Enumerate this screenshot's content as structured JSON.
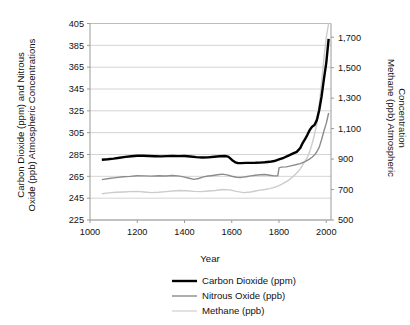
{
  "chart_data": {
    "type": "line",
    "title": "",
    "xlabel": "Year",
    "ylabel": "Carbon Dioxide (ppm) and Nitrous Oxide (ppb) Atmospheric Concentrations",
    "y2label": "Methane (ppb) Atmospheric Concentration",
    "xlim": [
      1000,
      2020
    ],
    "ylim": [
      225,
      405
    ],
    "y2lim": [
      500,
      1790
    ],
    "grid": true,
    "legend_position": "bottom",
    "x_ticks": [
      1000,
      1200,
      1400,
      1600,
      1800,
      2000
    ],
    "x_tick_labels": [
      "1000",
      "1200",
      "1400",
      "1600",
      "1800",
      "2000"
    ],
    "y_ticks": [
      225,
      245,
      265,
      285,
      305,
      325,
      345,
      365,
      385,
      405
    ],
    "y_tick_labels": [
      "225",
      "245",
      "265",
      "285",
      "305",
      "325",
      "345",
      "365",
      "385",
      "405"
    ],
    "y2_ticks": [
      500,
      700,
      900,
      1100,
      1300,
      1500,
      1700
    ],
    "y2_tick_labels": [
      "500",
      "700",
      "900",
      "1,100",
      "1,300",
      "1,500",
      "1,700"
    ],
    "series": [
      {
        "name": "Carbon Dioxide (ppm)",
        "axis": "left",
        "color": "#000000",
        "width": 2.4,
        "x": [
          1050,
          1075,
          1100,
          1125,
          1150,
          1175,
          1200,
          1225,
          1250,
          1275,
          1300,
          1325,
          1350,
          1375,
          1400,
          1425,
          1450,
          1475,
          1500,
          1525,
          1550,
          1570,
          1585,
          1595,
          1605,
          1615,
          1625,
          1640,
          1660,
          1680,
          1700,
          1720,
          1740,
          1760,
          1780,
          1800,
          1820,
          1840,
          1860,
          1875,
          1890,
          1900,
          1910,
          1920,
          1930,
          1940,
          1950,
          1960,
          1970,
          1980,
          1990,
          2000,
          2010
        ],
        "y": [
          280.2,
          280.6,
          281.2,
          282.0,
          282.8,
          283.4,
          283.9,
          283.8,
          283.6,
          283.4,
          283.3,
          283.5,
          283.7,
          283.5,
          283.6,
          283.2,
          282.6,
          282.3,
          282.4,
          282.9,
          283.4,
          283.6,
          283.0,
          281.2,
          279.2,
          277.8,
          277.2,
          277.1,
          277.3,
          277.3,
          277.4,
          277.6,
          277.9,
          278.3,
          279.0,
          280.5,
          282.0,
          284.0,
          286.0,
          287.4,
          291.0,
          295.5,
          299.0,
          303.0,
          307.5,
          310.5,
          312.0,
          316.5,
          325.5,
          338.0,
          354.0,
          369.0,
          391.0
        ]
      },
      {
        "name": "Nitrous Oxide (ppb)",
        "axis": "left",
        "color": "#8c8c8c",
        "width": 1.4,
        "x": [
          1050,
          1080,
          1110,
          1140,
          1170,
          1200,
          1230,
          1260,
          1290,
          1320,
          1350,
          1380,
          1400,
          1420,
          1440,
          1460,
          1480,
          1500,
          1520,
          1540,
          1560,
          1580,
          1600,
          1620,
          1640,
          1660,
          1680,
          1700,
          1720,
          1740,
          1760,
          1780,
          1795,
          1800,
          1810,
          1830,
          1850,
          1870,
          1890,
          1900,
          1910,
          1920,
          1930,
          1940,
          1950,
          1960,
          1970,
          1980,
          1990,
          2000,
          2010
        ],
        "y": [
          262.0,
          263.0,
          263.8,
          264.6,
          265.0,
          265.6,
          265.4,
          265.2,
          265.6,
          265.3,
          265.8,
          265.2,
          264.3,
          263.2,
          262.2,
          263.0,
          264.5,
          265.3,
          265.8,
          266.4,
          267.0,
          266.3,
          265.1,
          264.2,
          264.0,
          264.6,
          265.4,
          266.0,
          266.4,
          266.7,
          266.0,
          265.4,
          265.6,
          272.8,
          273.4,
          273.7,
          274.6,
          275.6,
          276.7,
          277.6,
          278.5,
          279.6,
          281.0,
          282.5,
          284.5,
          287.5,
          291.5,
          298.5,
          306.5,
          313.5,
          323.0
        ]
      },
      {
        "name": "Methane (ppb)",
        "axis": "right",
        "color": "#cccccc",
        "width": 1.4,
        "x": [
          1050,
          1080,
          1110,
          1140,
          1170,
          1200,
          1230,
          1260,
          1290,
          1320,
          1350,
          1380,
          1410,
          1440,
          1470,
          1500,
          1530,
          1560,
          1590,
          1620,
          1650,
          1680,
          1700,
          1720,
          1740,
          1760,
          1780,
          1800,
          1820,
          1840,
          1860,
          1880,
          1890,
          1900,
          1910,
          1920,
          1930,
          1940,
          1950,
          1960,
          1970,
          1980,
          1990,
          2000,
          2010
        ],
        "y": [
          672,
          678,
          682,
          684,
          686,
          688,
          684,
          680,
          682,
          686,
          690,
          694,
          692,
          688,
          686,
          690,
          694,
          700,
          698,
          688,
          680,
          684,
          690,
          696,
          700,
          706,
          714,
          726,
          742,
          760,
          786,
          816,
          836,
          862,
          886,
          912,
          950,
          1000,
          1060,
          1130,
          1250,
          1400,
          1560,
          1700,
          1790
        ]
      }
    ]
  },
  "legend": {
    "items": [
      {
        "label": "Carbon Dioxide (ppm)",
        "color": "#000000"
      },
      {
        "label": "Nitrous Oxide (ppb)",
        "color": "#8c8c8c"
      },
      {
        "label": "Methane (ppb)",
        "color": "#d6d6d6"
      }
    ]
  },
  "axes": {
    "x_title": "Year",
    "y_left_title_line1": "Carbon Dioxide (ppm) and Nitrous",
    "y_left_title_line2": "Oxide (ppb) Atmospheric Concentrations",
    "y_right_title_line1": "Methane (ppb) Atmospheric",
    "y_right_title_line2": "Concentration"
  }
}
